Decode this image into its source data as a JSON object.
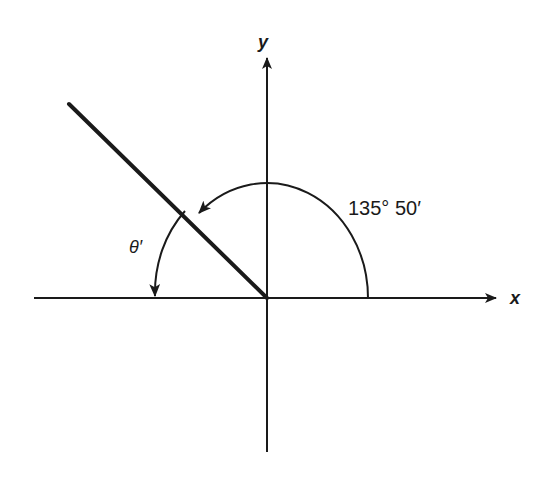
{
  "diagram": {
    "type": "reference-angle",
    "axes": {
      "x_label": "x",
      "y_label": "y"
    },
    "angle_label": "135° 50′",
    "reference_angle_label": "θ′",
    "colors": {
      "stroke": "#1a1a1a",
      "background": "#ffffff"
    }
  }
}
